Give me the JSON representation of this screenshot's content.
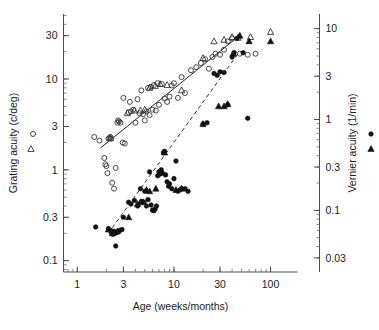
{
  "chart_data": {
    "type": "scatter",
    "title": "",
    "xlabel": "Age (weeks/months)",
    "ylabel": "Grating acuity (c/deg)",
    "y2label": "Vernier acuity (1/min)",
    "xscale": "log",
    "yscale": "log",
    "y2scale": "log",
    "xlim": [
      0.72,
      190
    ],
    "ylim": [
      0.075,
      52
    ],
    "y2lim": [
      0.021,
      14.5
    ],
    "grid": false,
    "legend_position": "outside-left-and-right",
    "xticks": [
      1,
      3,
      10,
      30,
      100
    ],
    "xticklabels": [
      "1",
      "3",
      "10",
      "30",
      "100"
    ],
    "yticks": [
      0.1,
      0.3,
      1,
      3,
      10,
      30
    ],
    "yticklabels": [
      "0.1",
      "0.3",
      "1",
      "3",
      "10",
      "30"
    ],
    "y2ticks": [
      0.03,
      0.1,
      0.3,
      1,
      3,
      10
    ],
    "y2ticklabels": [
      "0.03",
      "0.1",
      "0.3",
      "1",
      "3",
      "10"
    ],
    "legend": [
      {
        "key": "grating-circles",
        "marker": "open-circle",
        "side": "left",
        "axis": "left"
      },
      {
        "key": "grating-triangles",
        "marker": "open-triangle",
        "side": "left",
        "axis": "left"
      },
      {
        "key": "vernier-circles",
        "marker": "filled-circle",
        "side": "right",
        "axis": "right"
      },
      {
        "key": "vernier-triangles",
        "marker": "filled-triangle",
        "side": "right",
        "axis": "right"
      }
    ],
    "trend_lines": [
      {
        "name": "grating-fit",
        "style": "solid",
        "axis": "left",
        "x": [
          1.75,
          42
        ],
        "y": [
          1.75,
          27
        ]
      },
      {
        "name": "vernier-fit",
        "style": "dashed",
        "axis": "left",
        "x": [
          2.3,
          46
        ],
        "y": [
          0.23,
          19
        ]
      }
    ],
    "series": [
      {
        "name": "grating-acuity-circles",
        "marker": "open-circle",
        "axis": "left",
        "points": [
          [
            1.5,
            2.3
          ],
          [
            1.7,
            2.1
          ],
          [
            1.9,
            1.35
          ],
          [
            1.95,
            1.15
          ],
          [
            2.0,
            1.1
          ],
          [
            2.05,
            0.92
          ],
          [
            2.1,
            2.2
          ],
          [
            2.15,
            2.25
          ],
          [
            2.2,
            2.3
          ],
          [
            2.25,
            2.2
          ],
          [
            2.3,
            0.72
          ],
          [
            2.4,
            0.62
          ],
          [
            2.5,
            1.05
          ],
          [
            2.6,
            3.3
          ],
          [
            2.65,
            3.5
          ],
          [
            2.7,
            3.4
          ],
          [
            2.8,
            3.3
          ],
          [
            2.95,
            2.0
          ],
          [
            3.0,
            6.2
          ],
          [
            3.1,
            1.95
          ],
          [
            3.4,
            4.3
          ],
          [
            3.5,
            5.6
          ],
          [
            3.6,
            4.4
          ],
          [
            3.8,
            4.6
          ],
          [
            4.0,
            3.3
          ],
          [
            4.2,
            6.0
          ],
          [
            4.4,
            4.2
          ],
          [
            4.6,
            7.5
          ],
          [
            4.8,
            4.1
          ],
          [
            5.0,
            3.5
          ],
          [
            5.2,
            4.4
          ],
          [
            5.4,
            8.0
          ],
          [
            5.6,
            4.0
          ],
          [
            5.8,
            8.2
          ],
          [
            6.0,
            4.6
          ],
          [
            6.2,
            8.6
          ],
          [
            6.5,
            4.5
          ],
          [
            6.8,
            9.0
          ],
          [
            7.0,
            5.2
          ],
          [
            7.5,
            8.8
          ],
          [
            8.0,
            6.1
          ],
          [
            8.5,
            5.6
          ],
          [
            9.0,
            6.4
          ],
          [
            9.5,
            8.5
          ],
          [
            10.0,
            9.0
          ],
          [
            11.0,
            6.2
          ],
          [
            12.0,
            10.5
          ],
          [
            13.0,
            7.0
          ],
          [
            15.0,
            12.5
          ],
          [
            17.0,
            13.5
          ],
          [
            19.0,
            15.0
          ],
          [
            21.0,
            16.5
          ],
          [
            23.0,
            13.0
          ],
          [
            25.0,
            17.5
          ],
          [
            27.0,
            19.0
          ],
          [
            30.0,
            18.5
          ],
          [
            33.0,
            21.0
          ],
          [
            36.0,
            26.0
          ],
          [
            40.0,
            28.0
          ],
          [
            48.0,
            19.0
          ],
          [
            58.0,
            18.5
          ],
          [
            70.0,
            19.0
          ]
        ]
      },
      {
        "name": "grating-acuity-triangles",
        "marker": "open-triangle",
        "axis": "left",
        "points": [
          [
            2.2,
            2.25
          ],
          [
            3.3,
            4.2
          ],
          [
            3.9,
            4.5
          ],
          [
            4.5,
            4.5
          ],
          [
            5.0,
            4.6
          ],
          [
            5.6,
            8.0
          ],
          [
            6.4,
            8.4
          ],
          [
            7.2,
            8.8
          ],
          [
            8.5,
            8.6
          ],
          [
            12.0,
            7.5
          ],
          [
            20.0,
            17.0
          ],
          [
            26.0,
            26.0
          ],
          [
            33.0,
            27.0
          ],
          [
            40.0,
            29.0
          ],
          [
            46.0,
            28.5
          ],
          [
            62.0,
            29.0
          ],
          [
            100.0,
            33.0
          ]
        ]
      },
      {
        "name": "vernier-acuity-circles",
        "marker": "filled-circle",
        "axis": "left",
        "points": [
          [
            1.55,
            0.235
          ],
          [
            2.1,
            0.225
          ],
          [
            2.2,
            0.215
          ],
          [
            2.25,
            0.205
          ],
          [
            2.3,
            0.21
          ],
          [
            2.35,
            0.195
          ],
          [
            2.4,
            0.21
          ],
          [
            2.45,
            0.2
          ],
          [
            2.5,
            0.145
          ],
          [
            2.6,
            0.205
          ],
          [
            2.75,
            0.215
          ],
          [
            2.9,
            0.22
          ],
          [
            3.0,
            0.3
          ],
          [
            3.4,
            0.44
          ],
          [
            3.6,
            0.42
          ],
          [
            3.9,
            0.46
          ],
          [
            4.2,
            0.4
          ],
          [
            4.5,
            0.62
          ],
          [
            4.7,
            0.45
          ],
          [
            4.9,
            0.44
          ],
          [
            5.0,
            0.58
          ],
          [
            5.2,
            0.4
          ],
          [
            5.4,
            0.47
          ],
          [
            5.6,
            0.95
          ],
          [
            5.8,
            0.41
          ],
          [
            6.0,
            0.36
          ],
          [
            6.2,
            0.355
          ],
          [
            6.4,
            0.37
          ],
          [
            6.6,
            0.4
          ],
          [
            6.8,
            0.86
          ],
          [
            7.0,
            0.95
          ],
          [
            7.2,
            0.9
          ],
          [
            7.4,
            1.0
          ],
          [
            7.6,
            0.92
          ],
          [
            7.8,
            1.55
          ],
          [
            8.0,
            1.6
          ],
          [
            8.2,
            0.88
          ],
          [
            8.5,
            0.74
          ],
          [
            8.8,
            0.66
          ],
          [
            9.0,
            0.7
          ],
          [
            9.5,
            0.62
          ],
          [
            10.0,
            0.8
          ],
          [
            10.5,
            1.25
          ],
          [
            11.0,
            0.58
          ],
          [
            11.5,
            0.6
          ],
          [
            12.0,
            0.62
          ],
          [
            13.0,
            0.62
          ],
          [
            14.0,
            0.58
          ],
          [
            20.0,
            3.2
          ],
          [
            22.0,
            3.3
          ],
          [
            26.0,
            11.5
          ],
          [
            28.0,
            11.0
          ],
          [
            30.0,
            12.0
          ],
          [
            33.0,
            11.8
          ],
          [
            36.0,
            5.2
          ],
          [
            40.0,
            17.5
          ],
          [
            42.0,
            19.5
          ],
          [
            45.0,
            28.0
          ],
          [
            52.0,
            19.5
          ],
          [
            58.0,
            3.7
          ]
        ]
      },
      {
        "name": "vernier-acuity-triangles",
        "marker": "filled-triangle",
        "axis": "left",
        "points": [
          [
            2.1,
            0.22
          ],
          [
            2.3,
            0.2
          ],
          [
            2.4,
            0.205
          ],
          [
            2.6,
            0.21
          ],
          [
            3.4,
            0.3
          ],
          [
            4.2,
            0.42
          ],
          [
            4.5,
            0.44
          ],
          [
            5.2,
            0.6
          ],
          [
            5.6,
            0.58
          ],
          [
            6.5,
            0.62
          ],
          [
            8.0,
            1.55
          ],
          [
            10.5,
            0.6
          ],
          [
            12.0,
            0.62
          ],
          [
            20.0,
            3.2
          ],
          [
            29.0,
            5.0
          ],
          [
            33.0,
            5.0
          ],
          [
            36.0,
            5.3
          ],
          [
            41.0,
            19.0
          ],
          [
            48.0,
            30.0
          ],
          [
            60.0,
            26.0
          ],
          [
            100.0,
            26.0
          ]
        ]
      }
    ]
  }
}
